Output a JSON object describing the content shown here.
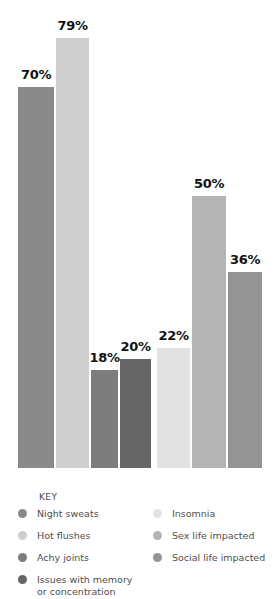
{
  "chart_data": {
    "type": "bar",
    "title": "",
    "subtitle": "",
    "xlabel": "",
    "ylabel": "",
    "ylim": [
      0,
      100
    ],
    "grid": false,
    "legend_position": "bottom",
    "categories": [
      "Night sweats",
      "Hot flushes",
      "Achy joints",
      "Issues with memory or concentration",
      "Insomnia",
      "Sex life impacted",
      "Social life impacted"
    ],
    "values": [
      70,
      79,
      18,
      20,
      22,
      50,
      36
    ],
    "value_labels": [
      "70%",
      "79%",
      "18%",
      "20%",
      "22%",
      "50%",
      "36%"
    ],
    "colors": [
      "#8a8a8a",
      "#cfcfcf",
      "#7d7d7d",
      "#666666",
      "#e2e2e2",
      "#b4b4b4",
      "#949494"
    ]
  },
  "legend": {
    "title": "KEY",
    "left_column": [
      {
        "label": "Night sweats",
        "color": "#8a8a8a"
      },
      {
        "label": "Hot flushes",
        "color": "#cfcfcf"
      },
      {
        "label": "Achy joints",
        "color": "#7d7d7d"
      },
      {
        "label": "Issues with memory\nor concentration",
        "color": "#666666"
      }
    ],
    "right_column": [
      {
        "label": "Insomnia",
        "color": "#e2e2e2"
      },
      {
        "label": "Sex life impacted",
        "color": "#b4b4b4"
      },
      {
        "label": "Social life impacted",
        "color": "#949494"
      }
    ]
  }
}
